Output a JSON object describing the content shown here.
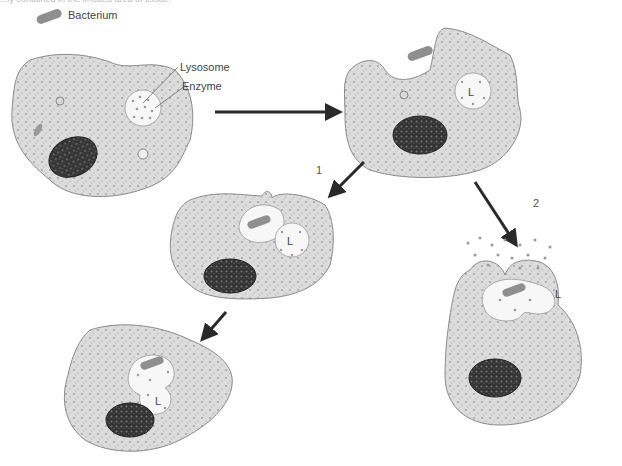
{
  "caption_fragment": "...ly contained in the knotted area of tissue.",
  "legend": {
    "bacterium_label": "Bacterium",
    "bacterium_icon": "bacterium-icon"
  },
  "labels": {
    "lysosome": "Lysosome",
    "enzyme": "Enzyme",
    "lysosome_marker": "L"
  },
  "steps": {
    "branch_1": "1",
    "branch_2": "2"
  },
  "colors": {
    "cytoplasm": "#d9d9d9",
    "cell_outline": "#8a8a8a",
    "nucleus": "#2e2e2e",
    "vacuole": "#f7f7f7",
    "bacterium": "#8f8f8f",
    "arrow": "#2a2a2a",
    "enzyme_dot": "#9a9a9a"
  },
  "stages": [
    {
      "id": "cell-1",
      "description": "Cell with lysosome containing enzymes; bacterium nearby"
    },
    {
      "id": "cell-2",
      "description": "Cell engulfing bacterium (phagocytosis)"
    },
    {
      "id": "cell-3",
      "description": "Phagosome containing bacterium next to lysosome (path 1)"
    },
    {
      "id": "cell-4",
      "description": "Lysosome fused with phagosome; enzymes digest bacterium"
    },
    {
      "id": "cell-5",
      "description": "Enzymes released outside cell during engulfment (path 2)"
    }
  ]
}
